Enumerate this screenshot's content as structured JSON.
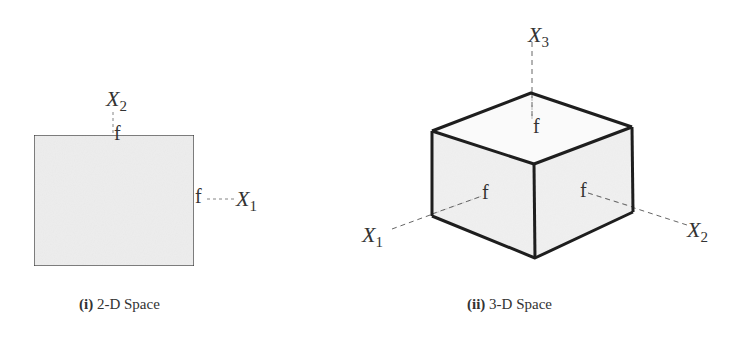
{
  "figure": {
    "colors": {
      "face_fill": "#ededed",
      "edge": "#1e1e1e",
      "dash": "#666666",
      "text": "#333333"
    },
    "panels": [
      {
        "id": "2d",
        "caption_prefix": "(i)",
        "caption_text": "2-D Space",
        "axes": [
          {
            "name": "X",
            "subscript": "2"
          },
          {
            "name": "X",
            "subscript": "1"
          }
        ],
        "face_labels": [
          "f",
          "f"
        ]
      },
      {
        "id": "3d",
        "caption_prefix": "(ii)",
        "caption_text": "3-D Space",
        "axes": [
          {
            "name": "X",
            "subscript": "3"
          },
          {
            "name": "X",
            "subscript": "1"
          },
          {
            "name": "X",
            "subscript": "2"
          }
        ],
        "face_labels": [
          "f",
          "f",
          "f"
        ]
      }
    ]
  }
}
